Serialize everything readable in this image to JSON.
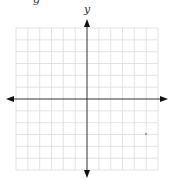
{
  "diagram": {
    "type": "coordinate-plane",
    "y_axis_label": "y",
    "x_axis_label": "x",
    "grid": {
      "columns": 12,
      "rows": 12,
      "color": "#dcdcdc"
    },
    "axis_color": "#222222",
    "point": {
      "description": "small dot in fourth quadrant",
      "color": "#777777"
    },
    "partial_top_text": "g",
    "partial_right_text": "("
  }
}
